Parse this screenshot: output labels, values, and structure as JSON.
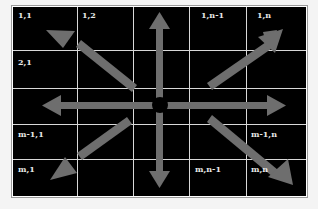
{
  "diagram": {
    "title": "",
    "colors": {
      "background": "#000000",
      "grid_lines": "#d8d8d8",
      "arrows": "#6e6e6e",
      "labels": "#e8e8e8",
      "center_dot": "#000000"
    },
    "grid": {
      "rows": 5,
      "cols": 5
    },
    "cell_labels": {
      "r1c1": "1,1",
      "r1c2": "1,2",
      "r1c4": "1,n-1",
      "r1c5": "1,n",
      "r2c1": "2,1",
      "r4c1": "m-1,1",
      "r4c5": "m-1,n",
      "r5c1": "m,1",
      "r5c4": "m,n-1",
      "r5c5": "m,n"
    },
    "arrows": [
      {
        "direction": "up"
      },
      {
        "direction": "down"
      },
      {
        "direction": "left"
      },
      {
        "direction": "right"
      },
      {
        "direction": "up-left"
      },
      {
        "direction": "up-right"
      },
      {
        "direction": "down-left"
      },
      {
        "direction": "down-right"
      }
    ]
  }
}
